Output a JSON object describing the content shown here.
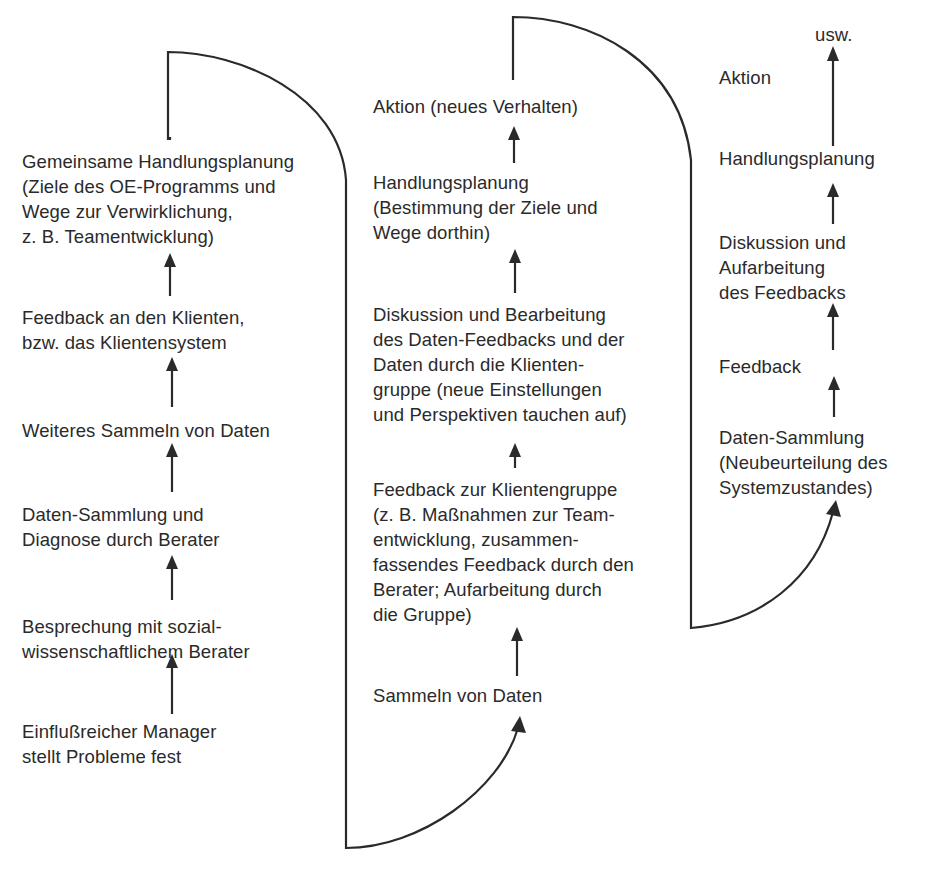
{
  "diagram": {
    "type": "flow-diagram",
    "columns": [
      {
        "id": "cycle-1",
        "steps_bottom_to_top": [
          "Einflußreicher Manager\nstellt Probleme fest",
          "Besprechung mit sozial-\nwissenschaftlichem Berater",
          "Daten-Sammlung und\nDiagnose durch Berater",
          "Weiteres Sammeln von Daten",
          "Feedback an den Klienten,\nbzw. das Klientensystem",
          "Gemeinsame Handlungsplanung\n(Ziele des OE-Programms und\nWege zur Verwirklichung,\nz. B. Teamentwicklung)"
        ]
      },
      {
        "id": "cycle-2",
        "steps_bottom_to_top": [
          "Sammeln von Daten",
          "Feedback zur Klientengruppe\n(z. B. Maßnahmen zur Team-\nentwicklung, zusammen-\nfassendes Feedback durch den\nBerater; Aufarbeitung durch\ndie Gruppe)",
          "Diskussion und Bearbeitung\ndes Daten-Feedbacks und der\nDaten durch die Klienten-\ngruppe (neue Einstellungen\nund Perspektiven tauchen auf)",
          "Handlungsplanung\n(Bestimmung der Ziele und\nWege dorthin)",
          "Aktion (neues Verhalten)"
        ]
      },
      {
        "id": "cycle-3",
        "steps_bottom_to_top": [
          "Daten-Sammlung\n(Neubeurteilung des\nSystemzustandes)",
          "Feedback",
          "Diskussion und\nAufarbeitung\ndes Feedbacks",
          "Handlungsplanung",
          "Aktion",
          "usw."
        ]
      }
    ],
    "connectors": [
      {
        "from": "cycle-1 top",
        "to": "cycle-2 bottom (Sammeln von Daten)",
        "shape": "loop-over-and-down"
      },
      {
        "from": "cycle-2 top",
        "to": "cycle-3 bottom (Daten-Sammlung)",
        "shape": "loop-over-and-down"
      }
    ]
  },
  "labels": {
    "c1_s1": "Einflußreicher Manager\nstellt Probleme fest",
    "c1_s2": "Besprechung mit sozial-\nwissenschaftlichem Berater",
    "c1_s3": "Daten-Sammlung und\nDiagnose durch Berater",
    "c1_s4": "Weiteres Sammeln von Daten",
    "c1_s5": "Feedback an den Klienten,\nbzw. das Klientensystem",
    "c1_s6": "Gemeinsame Handlungsplanung\n(Ziele des OE-Programms und\nWege zur Verwirklichung,\nz. B. Teamentwicklung)",
    "c2_s1": "Sammeln von Daten",
    "c2_s2": "Feedback zur Klientengruppe\n(z. B. Maßnahmen zur Team-\nentwicklung, zusammen-\nfassendes Feedback durch den\nBerater; Aufarbeitung durch\ndie Gruppe)",
    "c2_s3": "Diskussion und Bearbeitung\ndes Daten-Feedbacks und der\nDaten durch die Klienten-\ngruppe (neue Einstellungen\nund Perspektiven tauchen auf)",
    "c2_s4": "Handlungsplanung\n(Bestimmung der Ziele und\nWege dorthin)",
    "c2_s5": "Aktion (neues Verhalten)",
    "c3_s1": "Daten-Sammlung\n(Neubeurteilung des\nSystemzustandes)",
    "c3_s2": "Feedback",
    "c3_s3": "Diskussion und\nAufarbeitung\ndes Feedbacks",
    "c3_s4": "Handlungsplanung",
    "c3_s5": "Aktion",
    "c3_s6": "usw."
  },
  "colors": {
    "ink": "#2a2a2a",
    "background": "#ffffff"
  }
}
